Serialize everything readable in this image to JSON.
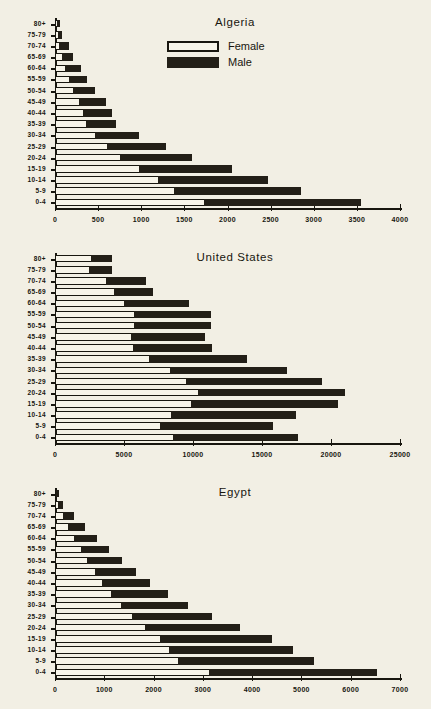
{
  "page": {
    "background": "#f2efe4",
    "ink": "#18160f"
  },
  "legend": {
    "position": "top-center-of-first-chart",
    "items": [
      {
        "label": "Female",
        "swatch": "hollow-white-box",
        "color": "#f7f4e9"
      },
      {
        "label": "Male",
        "swatch": "filled-black-box",
        "color": "#231f17"
      }
    ]
  },
  "age_groups": [
    "80+",
    "75-79",
    "70-74",
    "65-69",
    "60-64",
    "55-59",
    "50-54",
    "45-49",
    "40-44",
    "35-39",
    "30-34",
    "25-29",
    "20-24",
    "15-19",
    "10-14",
    "5-9",
    "0-4"
  ],
  "chart_data": [
    {
      "type": "bar",
      "orientation": "horizontal",
      "stacked": true,
      "title": "Algeria",
      "xlabel": "",
      "ylabel": "",
      "xlim": [
        0,
        4000
      ],
      "xticks": [
        0,
        500,
        1000,
        1500,
        2000,
        2500,
        3000,
        3500,
        4000
      ],
      "xtick_labels": [
        "0",
        "500",
        "1000",
        "1500",
        "2000",
        "2500",
        "3000",
        "3500",
        "4000"
      ],
      "grid": false,
      "legend_position": "upper center",
      "categories": [
        "80+",
        "75-79",
        "70-74",
        "65-69",
        "60-64",
        "55-59",
        "50-54",
        "45-49",
        "40-44",
        "35-39",
        "30-34",
        "25-29",
        "20-24",
        "15-19",
        "10-14",
        "5-9",
        "0-4"
      ],
      "series": [
        {
          "name": "Female",
          "values": [
            30,
            45,
            60,
            90,
            130,
            175,
            225,
            290,
            340,
            370,
            480,
            620,
            760,
            985,
            1200,
            1395,
            1735
          ]
        },
        {
          "name": "Male",
          "values": [
            35,
            45,
            110,
            125,
            180,
            205,
            250,
            310,
            335,
            345,
            505,
            680,
            840,
            1080,
            1280,
            1465,
            1830
          ]
        }
      ],
      "totals": [
        65,
        90,
        170,
        215,
        310,
        380,
        475,
        600,
        675,
        715,
        985,
        1300,
        1600,
        2065,
        2480,
        2860,
        3565
      ]
    },
    {
      "type": "bar",
      "orientation": "horizontal",
      "stacked": true,
      "title": "United States",
      "xlabel": "",
      "ylabel": "",
      "xlim": [
        0,
        25000
      ],
      "xticks": [
        0,
        5000,
        10000,
        15000,
        20000,
        25000
      ],
      "xtick_labels": [
        "0",
        "5000",
        "10000",
        "15000",
        "20000",
        "25000"
      ],
      "grid": false,
      "categories": [
        "80+",
        "75-79",
        "70-74",
        "65-69",
        "60-64",
        "55-59",
        "50-54",
        "45-49",
        "40-44",
        "35-39",
        "30-34",
        "25-29",
        "20-24",
        "15-19",
        "10-14",
        "5-9",
        "0-4"
      ],
      "series": [
        {
          "name": "Female",
          "values": [
            2650,
            2500,
            3750,
            4350,
            5100,
            5800,
            5800,
            5550,
            5750,
            6900,
            8400,
            9600,
            10400,
            9950,
            8450,
            7700,
            8650
          ]
        },
        {
          "name": "Male",
          "values": [
            1550,
            1700,
            2950,
            2850,
            4700,
            5600,
            5600,
            5400,
            5700,
            7050,
            8500,
            9850,
            10700,
            10650,
            9100,
            8200,
            9050
          ]
        }
      ],
      "totals": [
        4200,
        4200,
        6700,
        7200,
        9800,
        11400,
        11400,
        10950,
        11450,
        13950,
        16900,
        19450,
        21100,
        20600,
        17550,
        15900,
        17700
      ]
    },
    {
      "type": "bar",
      "orientation": "horizontal",
      "stacked": true,
      "title": "Egypt",
      "xlabel": "",
      "ylabel": "",
      "xlim": [
        0,
        7000
      ],
      "xticks": [
        0,
        1000,
        2000,
        3000,
        4000,
        5000,
        6000,
        7000
      ],
      "xtick_labels": [
        "0",
        "1000",
        "2000",
        "3000",
        "4000",
        "5000",
        "6000",
        "7000"
      ],
      "grid": false,
      "categories": [
        "80+",
        "75-79",
        "70-74",
        "65-69",
        "60-64",
        "55-59",
        "50-54",
        "45-49",
        "40-44",
        "35-39",
        "30-34",
        "25-29",
        "20-24",
        "15-19",
        "10-14",
        "5-9",
        "0-4"
      ],
      "series": [
        {
          "name": "Female",
          "values": [
            50,
            90,
            190,
            290,
            410,
            540,
            670,
            830,
            980,
            1160,
            1360,
            1580,
            1840,
            2150,
            2340,
            2510,
            3150
          ]
        },
        {
          "name": "Male",
          "values": [
            50,
            100,
            210,
            330,
            470,
            580,
            710,
            830,
            960,
            1160,
            1360,
            1630,
            1930,
            2280,
            2500,
            2770,
            3400
          ]
        }
      ],
      "totals": [
        100,
        190,
        400,
        620,
        880,
        1120,
        1380,
        1660,
        1940,
        2320,
        2720,
        3210,
        3770,
        4430,
        4840,
        5280,
        6550
      ]
    }
  ]
}
